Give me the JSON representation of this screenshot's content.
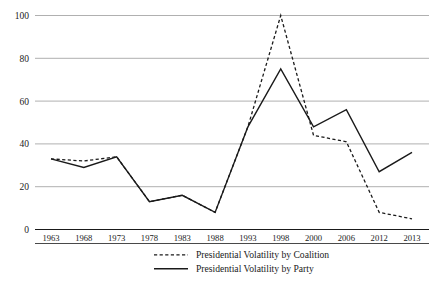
{
  "chart_data": {
    "type": "line",
    "title": "",
    "subtitle": "",
    "xlabel": "",
    "ylabel": "",
    "categories": [
      "1963",
      "1968",
      "1973",
      "1978",
      "1983",
      "1988",
      "1993",
      "1998",
      "2000",
      "2006",
      "2012",
      "2013"
    ],
    "ylim": [
      0,
      100
    ],
    "xlim_categories": [
      "1963",
      "2013"
    ],
    "grid": "horizontal",
    "legend_position": "bottom",
    "yticks": [
      "0",
      "20",
      "40",
      "60",
      "80",
      "100"
    ],
    "ytick_values": [
      0,
      20,
      40,
      60,
      80,
      100
    ],
    "series": [
      {
        "name": "Presidential Volatility by Coalition",
        "style": "dashed",
        "color": "#1a1a1a",
        "values": [
          33,
          32,
          34,
          13,
          16,
          8,
          48,
          100,
          44,
          41,
          8,
          5
        ]
      },
      {
        "name": "Presidential Volatility by Party",
        "style": "solid",
        "color": "#1a1a1a",
        "values": [
          33,
          29,
          34,
          13,
          16,
          8,
          48,
          75,
          48,
          56,
          27,
          36
        ]
      }
    ],
    "legend": [
      {
        "label": "Presidential Volatility by Coalition",
        "style": "dashed"
      },
      {
        "label": "Presidential Volatility by Party",
        "style": "solid"
      }
    ],
    "colors": {
      "line": "#1a1a1a",
      "grid": "#b0b0b0",
      "axis": "#1a1a1a",
      "background": "#ffffff"
    }
  }
}
